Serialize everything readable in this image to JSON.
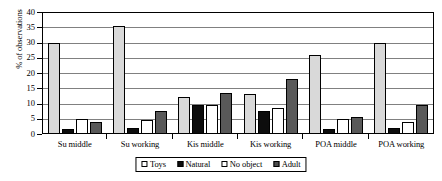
{
  "chart_data": {
    "type": "bar",
    "title": "",
    "xlabel": "",
    "ylabel": "% of observations",
    "ylim": [
      0,
      40
    ],
    "ytick_step": 5,
    "yticks": [
      0,
      5,
      10,
      15,
      20,
      25,
      30,
      35,
      40
    ],
    "grid": true,
    "legend_position": "bottom",
    "categories": [
      "Su middle",
      "Su working",
      "Kis middle",
      "Kis working",
      "POA middle",
      "POA working"
    ],
    "series": [
      {
        "name": "Toys",
        "color": "#d9d9d9",
        "values": [
          30,
          35.5,
          12,
          13,
          26,
          30
        ]
      },
      {
        "name": "Natural",
        "color": "#0d0d0d",
        "values": [
          1.5,
          2,
          9.5,
          7.5,
          1.5,
          2
        ]
      },
      {
        "name": "No object",
        "color": "#ffffff",
        "values": [
          5,
          4.5,
          9.5,
          8.5,
          5,
          4
        ]
      },
      {
        "name": "Adult",
        "color": "#595959",
        "values": [
          4,
          7.5,
          13.5,
          18,
          5.5,
          9.5
        ]
      }
    ]
  },
  "axis": {
    "y_title": "% of observations",
    "y_tick_labels": [
      "40",
      "35",
      "30",
      "25",
      "20",
      "15",
      "10",
      "5",
      "0"
    ]
  },
  "legend": {
    "items": [
      {
        "label": "Toys"
      },
      {
        "label": "Natural"
      },
      {
        "label": "No object"
      },
      {
        "label": "Adult"
      }
    ]
  }
}
